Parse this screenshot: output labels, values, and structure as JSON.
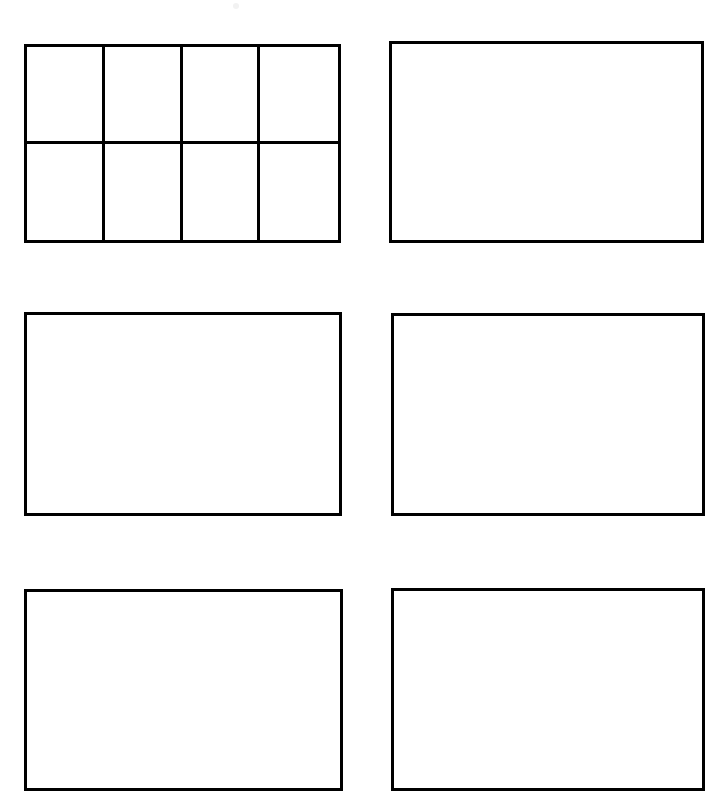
{
  "page": {
    "width": 725,
    "height": 804,
    "background_color": "#ffffff",
    "line_color": "#000000",
    "line_width_px": 3,
    "panel_count": 6,
    "empty_content_label": ""
  },
  "artifacts": [
    {
      "name": "scan-speck-top",
      "x": 233,
      "y": 3,
      "size": 6
    }
  ],
  "panels": [
    {
      "id": "panel-1",
      "label": "",
      "row": 1,
      "column": 1,
      "x": 24,
      "y": 44,
      "width": 317,
      "height": 199,
      "subdivided": true,
      "grid_columns": 4,
      "grid_rows": 2,
      "cell_count": 8,
      "cells": [
        {
          "id": "cell-1-1",
          "label": ""
        },
        {
          "id": "cell-1-2",
          "label": ""
        },
        {
          "id": "cell-1-3",
          "label": ""
        },
        {
          "id": "cell-1-4",
          "label": ""
        },
        {
          "id": "cell-2-1",
          "label": ""
        },
        {
          "id": "cell-2-2",
          "label": ""
        },
        {
          "id": "cell-2-3",
          "label": ""
        },
        {
          "id": "cell-2-4",
          "label": ""
        }
      ]
    },
    {
      "id": "panel-2",
      "label": "",
      "row": 1,
      "column": 2,
      "x": 389,
      "y": 41,
      "width": 315,
      "height": 202,
      "subdivided": false,
      "cells": []
    },
    {
      "id": "panel-3",
      "label": "",
      "row": 2,
      "column": 1,
      "x": 24,
      "y": 312,
      "width": 318,
      "height": 204,
      "subdivided": false,
      "cells": []
    },
    {
      "id": "panel-4",
      "label": "",
      "row": 2,
      "column": 2,
      "x": 391,
      "y": 313,
      "width": 314,
      "height": 203,
      "subdivided": false,
      "cells": []
    },
    {
      "id": "panel-5",
      "label": "",
      "row": 3,
      "column": 1,
      "x": 24,
      "y": 589,
      "width": 319,
      "height": 202,
      "subdivided": false,
      "cells": []
    },
    {
      "id": "panel-6",
      "label": "",
      "row": 3,
      "column": 2,
      "x": 391,
      "y": 588,
      "width": 314,
      "height": 203,
      "subdivided": false,
      "cells": []
    }
  ]
}
